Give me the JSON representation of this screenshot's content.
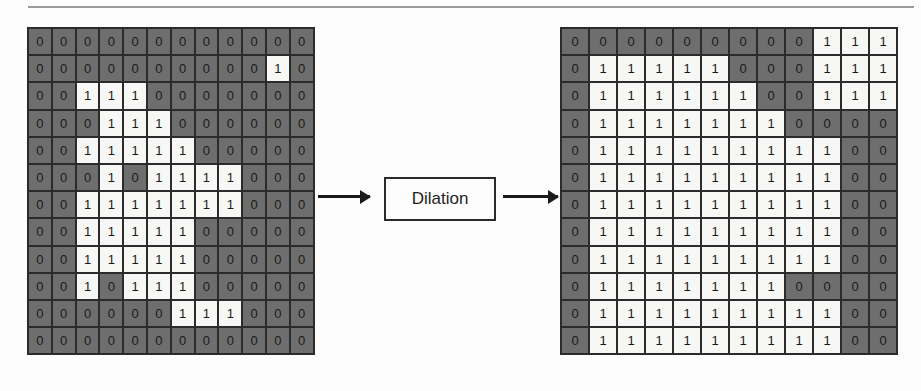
{
  "figure": {
    "operation_label": "Dilation",
    "colors": {
      "zero_cell_bg": "#6e6e6e",
      "one_cell_bg": "#f7f7f5",
      "grid_line": "#2b2b2b",
      "digit_text": "#1a1a1a",
      "arrow": "#1a1a1a",
      "rule": "#9a9a9a"
    },
    "icons": {
      "arrow_in": "arrow-right-icon",
      "arrow_out": "arrow-right-icon"
    }
  },
  "chart_data": {
    "type": "heatmap",
    "title": "",
    "xlabel": "",
    "ylabel": "",
    "grid": true,
    "legend": "none",
    "value_labels": [
      "0",
      "1"
    ],
    "panels": [
      {
        "name": "input",
        "role": "source binary image",
        "rows": 12,
        "cols": 12,
        "values": [
          [
            0,
            0,
            0,
            0,
            0,
            0,
            0,
            0,
            0,
            0,
            0,
            0
          ],
          [
            0,
            0,
            0,
            0,
            0,
            0,
            0,
            0,
            0,
            0,
            1,
            0
          ],
          [
            0,
            0,
            1,
            1,
            1,
            0,
            0,
            0,
            0,
            0,
            0,
            0
          ],
          [
            0,
            0,
            0,
            1,
            1,
            1,
            0,
            0,
            0,
            0,
            0,
            0
          ],
          [
            0,
            0,
            1,
            1,
            1,
            1,
            1,
            0,
            0,
            0,
            0,
            0
          ],
          [
            0,
            0,
            0,
            1,
            0,
            1,
            1,
            1,
            1,
            0,
            0,
            0
          ],
          [
            0,
            0,
            1,
            1,
            1,
            1,
            1,
            1,
            1,
            0,
            0,
            0
          ],
          [
            0,
            0,
            1,
            1,
            1,
            1,
            1,
            0,
            0,
            0,
            0,
            0
          ],
          [
            0,
            0,
            1,
            1,
            1,
            1,
            1,
            0,
            0,
            0,
            0,
            0
          ],
          [
            0,
            0,
            1,
            0,
            1,
            1,
            1,
            0,
            0,
            0,
            0,
            0
          ],
          [
            0,
            0,
            0,
            0,
            0,
            0,
            1,
            1,
            1,
            0,
            0,
            0
          ],
          [
            0,
            0,
            0,
            0,
            0,
            0,
            0,
            0,
            0,
            0,
            0,
            0
          ]
        ]
      },
      {
        "name": "output",
        "role": "dilated binary image",
        "rows": 12,
        "cols": 12,
        "values": [
          [
            0,
            0,
            0,
            0,
            0,
            0,
            0,
            0,
            0,
            1,
            1,
            1
          ],
          [
            0,
            1,
            1,
            1,
            1,
            1,
            0,
            0,
            0,
            1,
            1,
            1
          ],
          [
            0,
            1,
            1,
            1,
            1,
            1,
            1,
            0,
            0,
            1,
            1,
            1
          ],
          [
            0,
            1,
            1,
            1,
            1,
            1,
            1,
            1,
            0,
            0,
            0,
            0
          ],
          [
            0,
            1,
            1,
            1,
            1,
            1,
            1,
            1,
            1,
            1,
            0,
            0
          ],
          [
            0,
            1,
            1,
            1,
            1,
            1,
            1,
            1,
            1,
            1,
            0,
            0
          ],
          [
            0,
            1,
            1,
            1,
            1,
            1,
            1,
            1,
            1,
            1,
            0,
            0
          ],
          [
            0,
            1,
            1,
            1,
            1,
            1,
            1,
            1,
            1,
            1,
            0,
            0
          ],
          [
            0,
            1,
            1,
            1,
            1,
            1,
            1,
            1,
            1,
            1,
            0,
            0
          ],
          [
            0,
            1,
            1,
            1,
            1,
            1,
            1,
            1,
            0,
            0,
            0,
            0
          ],
          [
            0,
            1,
            1,
            1,
            1,
            1,
            1,
            1,
            1,
            1,
            0,
            0
          ],
          [
            0,
            1,
            1,
            1,
            1,
            1,
            1,
            1,
            1,
            1,
            0,
            0
          ],
          [
            0,
            0,
            0,
            0,
            0,
            1,
            1,
            1,
            1,
            1,
            0,
            0
          ]
        ]
      }
    ]
  }
}
